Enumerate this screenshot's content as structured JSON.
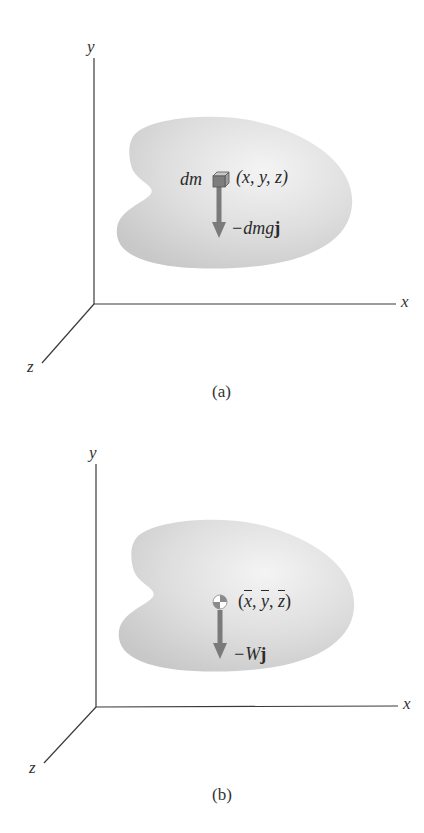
{
  "figure": {
    "panels": [
      {
        "id": "a",
        "caption": "(a)",
        "axes": {
          "x_label": "x",
          "y_label": "y",
          "z_label": "z"
        },
        "element": {
          "mass_label": "dm",
          "position_label": "(x, y, z)",
          "force_label_prefix": "−dmg",
          "force_label_vector": "j",
          "symbol": "cube-element"
        }
      },
      {
        "id": "b",
        "caption": "(b)",
        "axes": {
          "x_label": "x",
          "y_label": "y",
          "z_label": "z"
        },
        "element": {
          "position_open": "(",
          "xbar": "x",
          "ybar": "y",
          "zbar": "z",
          "sep": ", ",
          "position_close": ")",
          "force_label_prefix": "−W",
          "force_label_vector": "j",
          "symbol": "center-of-gravity"
        }
      }
    ],
    "colors": {
      "axis": "#3a3a3a",
      "body_fill_light": "#f2f2f2",
      "body_fill_dark": "#cfcfcf",
      "arrow": "#7a7a7a",
      "cube_front": "#7d7d7d",
      "cube_top": "#c8c8c8",
      "cube_side": "#a0a0a0",
      "cog_dark": "#8a8a8a",
      "cog_light": "#ffffff"
    }
  }
}
